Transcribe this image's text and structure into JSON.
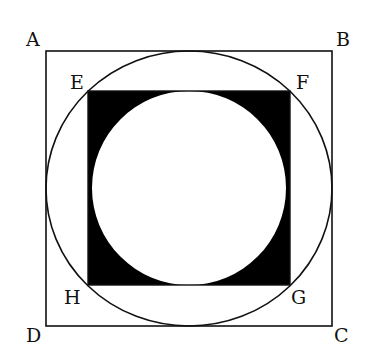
{
  "diagram": {
    "labels": {
      "A": "A",
      "B": "B",
      "C": "C",
      "D": "D",
      "E": "E",
      "F": "F",
      "G": "G",
      "H": "H"
    },
    "colors": {
      "stroke": "#111111",
      "fill_shaded": "#000000",
      "background": "#ffffff"
    }
  }
}
